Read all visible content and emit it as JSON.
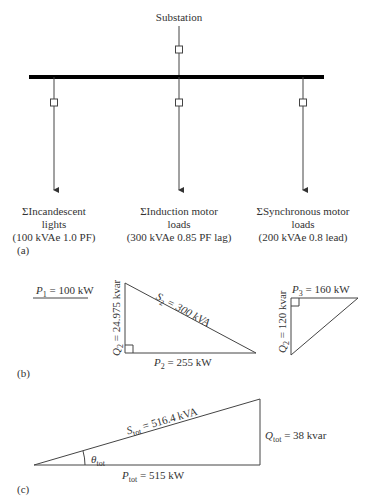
{
  "part_a": {
    "label": "(a)",
    "source": "Substation",
    "loads": [
      {
        "line1": "ΣIncandescent",
        "line2": "lights",
        "line3": "(100 kVAe 1.0 PF)"
      },
      {
        "line1": "ΣInduction motor",
        "line2": "loads",
        "line3": "(300 kVAe 0.85 PF lag)"
      },
      {
        "line1": "ΣSynchronous motor",
        "line2": "loads",
        "line3": "(200 kVAe 0.8 lead)"
      }
    ]
  },
  "part_b": {
    "label": "(b)",
    "p1": {
      "sym": "P",
      "sub": "1",
      "value": " = 100 kW"
    },
    "tri2": {
      "s": {
        "sym": "S",
        "sub": "2",
        "value": " = 300 kVA"
      },
      "q": {
        "sym": "Q",
        "sub": "2",
        "value": " = 24.975 kvar"
      },
      "p": {
        "sym": "P",
        "sub": "2",
        "value": " = 255 kW"
      }
    },
    "tri3": {
      "p": {
        "sym": "P",
        "sub": "3",
        "value": " = 160 kW"
      },
      "q": {
        "sym": "Q",
        "sub": "2",
        "value": " = 120 kvar"
      }
    }
  },
  "part_c": {
    "label": "(c)",
    "s": {
      "sym": "S",
      "sub": "tot",
      "value": " = 516.4 kVA"
    },
    "q": {
      "sym": "Q",
      "sub": "tot",
      "value": " = 38 kvar"
    },
    "p": {
      "sym": "P",
      "sub": "tot",
      "value": " = 515 kW"
    },
    "theta": {
      "sym": "θ",
      "sub": "tot"
    }
  }
}
